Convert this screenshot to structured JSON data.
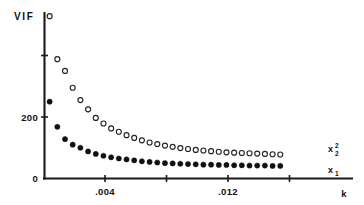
{
  "chart_data": {
    "type": "scatter",
    "title": "",
    "xlabel": "k",
    "ylabel": "VIF",
    "grid": false,
    "legend_position": "right-inside",
    "xlim": [
      0.0,
      0.0176
    ],
    "ylim": [
      0,
      560
    ],
    "x_ticks": [
      0.0,
      0.004,
      0.008,
      0.012,
      0.016
    ],
    "x_tick_labels": [
      "",
      ".004",
      "",
      ".012",
      ""
    ],
    "y_ticks": [
      0,
      200,
      400
    ],
    "y_tick_labels": [
      "0",
      "200",
      ""
    ],
    "x": [
      0.0004,
      0.0009,
      0.0014,
      0.0019,
      0.0024,
      0.0029,
      0.0034,
      0.0039,
      0.0044,
      0.0049,
      0.0054,
      0.0059,
      0.0064,
      0.0069,
      0.0074,
      0.0079,
      0.0084,
      0.0089,
      0.0094,
      0.0099,
      0.0104,
      0.0109,
      0.0114,
      0.0119,
      0.0124,
      0.0129,
      0.0134,
      0.0139,
      0.0144,
      0.0149,
      0.0154
    ],
    "series": [
      {
        "name": "x2^2",
        "label": "x",
        "label_sub": "2",
        "label_sup": "2",
        "marker": "open-circle",
        "color": "#242424",
        "values": [
          528,
          388,
          350,
          295,
          255,
          225,
          197,
          179,
          163,
          152,
          141,
          132,
          124,
          117,
          112,
          107,
          103,
          99,
          96,
          93,
          91,
          89,
          87,
          85,
          84,
          83,
          82,
          81,
          80,
          79,
          78
        ]
      },
      {
        "name": "x1",
        "label": "x",
        "label_sub": "1",
        "label_sup": "",
        "marker": "filled-circle",
        "color": "#101010",
        "values": [
          250,
          168,
          128,
          110,
          100,
          88,
          80,
          74,
          69,
          65,
          62,
          59,
          56,
          54,
          52,
          50,
          49,
          48,
          47,
          46,
          45,
          45,
          44,
          44,
          43,
          43,
          42,
          42,
          42,
          41,
          41
        ]
      }
    ],
    "annotations": []
  },
  "axis": {
    "y_title": "VIF",
    "x_title": "k",
    "y_label_zero": "0",
    "y_label_200": "200",
    "x_label_004": ".004",
    "x_label_012": ".012"
  },
  "legend": {
    "items": [
      {
        "base": "x",
        "sub": "2",
        "sup": "2"
      },
      {
        "base": "x",
        "sub": "1",
        "sup": ""
      }
    ]
  },
  "colors": {
    "axis": "#1a1a1a",
    "open_marker_stroke": "#242424",
    "filled_marker": "#101010",
    "background": "#ffffff"
  }
}
